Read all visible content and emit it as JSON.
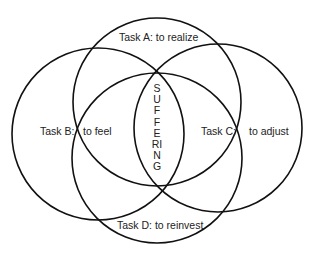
{
  "diagram": {
    "type": "four-circle-venn",
    "stroke_color": "#111111",
    "text_color": "#222222",
    "background": "#ffffff",
    "center_label": "SUFFERING",
    "circles": [
      {
        "id": "A",
        "cx": 157,
        "cy": 102,
        "r": 84
      },
      {
        "id": "B",
        "cx": 98,
        "cy": 134,
        "r": 86
      },
      {
        "id": "C",
        "cx": 218,
        "cy": 128,
        "r": 84
      },
      {
        "id": "D",
        "cx": 157,
        "cy": 158,
        "r": 85
      }
    ],
    "labels": {
      "task_a": "Task A: to realize",
      "task_b_name": "Task B:",
      "task_b_desc": "to feel",
      "task_c_name": "Task C:",
      "task_c_desc": "to adjust",
      "task_d": "Task D: to reinvest"
    }
  }
}
